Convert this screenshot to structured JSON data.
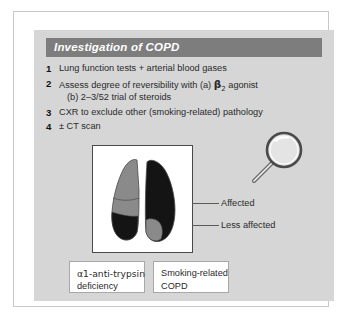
{
  "header": {
    "title": "Investigation of COPD"
  },
  "list": [
    {
      "num": "1",
      "text": "Lung function tests + arterial blood gases",
      "sub": false
    },
    {
      "num": "2",
      "text": "Assess degree of reversibility with (a) ",
      "beta": "β",
      "beta_sub": "2",
      "text_after": " agonist",
      "sub": false
    },
    {
      "num": "",
      "text": "(b) 2–3/52 trial of steroids",
      "sub": true
    },
    {
      "num": "3",
      "text": "CXR to exclude other (smoking-related) pathology",
      "sub": false
    },
    {
      "num": "4",
      "text": "± CT scan",
      "sub": false
    }
  ],
  "annotations": {
    "affected": "Affected",
    "less_affected": "Less affected"
  },
  "caption_boxes": {
    "left": {
      "line1": "α1-anti-trypsin",
      "line2": "deficiency"
    },
    "right": {
      "line1": "Smoking-related",
      "line2": "COPD"
    }
  },
  "diagram": {
    "lung_left_label": "left-lung",
    "lung_right_label": "right-lung",
    "magnifier_label": "magnifying-glass"
  },
  "colors": {
    "panel_background": "#d6d6d6",
    "header_bar": "#7d7d7d",
    "header_text": "#ffffff",
    "lung_affected_dark": "#141414",
    "lung_less_affected_grey": "#8a8a8a",
    "image_panel_background": "#ffffff",
    "frame_border": "#c9c9c9",
    "body_text": "#2a2a2a"
  }
}
